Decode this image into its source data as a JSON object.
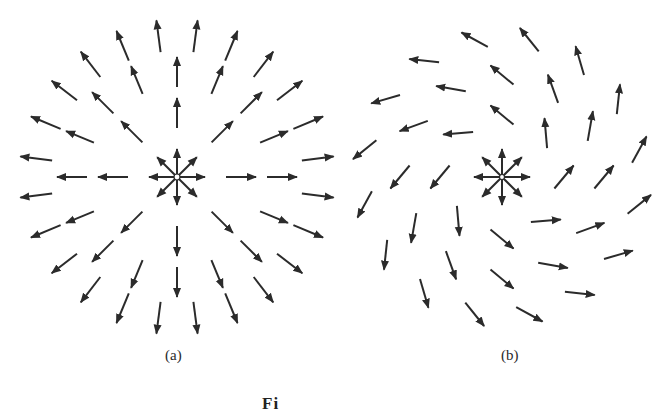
{
  "figure": {
    "panels": [
      {
        "id": "a",
        "label": "(a)",
        "description": "Radial outward vector field (pure divergence) with source at center",
        "center": [
          177,
          177
        ],
        "rings": [
          {
            "radius": 0,
            "count": 8,
            "length": 28,
            "from_center": true
          },
          {
            "radius": 64,
            "count": 8,
            "length": 30
          },
          {
            "radius": 105,
            "count": 16,
            "length": 30
          },
          {
            "radius": 142,
            "count": 24,
            "length": 32
          }
        ],
        "rotation_deg": 0
      },
      {
        "id": "b",
        "label": "(b)",
        "description": "Spiral vector field: radial outward component combined with counterclockwise rotation",
        "center": [
          502,
          177
        ],
        "rings": [
          {
            "radius": 0,
            "count": 8,
            "length": 28,
            "from_center": true
          },
          {
            "radius": 62,
            "count": 8,
            "length": 30
          },
          {
            "radius": 102,
            "count": 12,
            "length": 30
          },
          {
            "radius": 140,
            "count": 16,
            "length": 30
          },
          {
            "radius": 160,
            "count": 0,
            "length": 30
          }
        ],
        "rotation_deg": -50
      }
    ],
    "caption_partial": "Fi"
  },
  "style": {
    "arrow_color": "#2b2b2b",
    "background": "#ffffff"
  }
}
